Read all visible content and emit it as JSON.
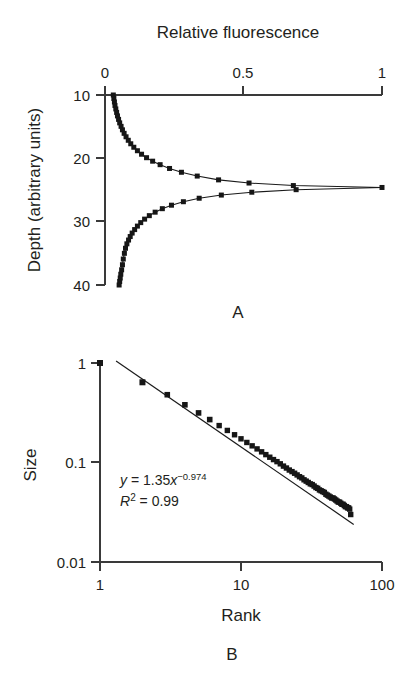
{
  "figure": {
    "background_color": "#ffffff",
    "ink_color": "#231f20",
    "marker_color": "#161616",
    "axis_color": "#3a3a3a"
  },
  "panels": [
    {
      "letter": "A",
      "name": "fluorescence-depth-profile"
    },
    {
      "letter": "B",
      "name": "rank-size-power-law"
    }
  ],
  "chart_data": [
    {
      "type": "line",
      "panel": "A",
      "title": "Relative fluorescence",
      "xlabel": "Relative fluorescence",
      "ylabel": "Depth (arbitrary units)",
      "xlim": [
        0,
        1
      ],
      "ylim": [
        40,
        10
      ],
      "y_inverted": true,
      "x_axis_position": "top",
      "grid": false,
      "legend": null,
      "xticks": [
        0,
        0.5,
        1
      ],
      "xticklabels": [
        "0",
        "0.5",
        "1"
      ],
      "yticks": [
        10,
        20,
        30,
        40
      ],
      "yticklabels": [
        "10",
        "20",
        "30",
        "40"
      ],
      "annotations": [
        "A"
      ],
      "series": [
        {
          "name": "fluorescence",
          "x": [
            0.03,
            0.032,
            0.034,
            0.036,
            0.039,
            0.042,
            0.045,
            0.049,
            0.053,
            0.058,
            0.063,
            0.069,
            0.076,
            0.084,
            0.093,
            0.104,
            0.117,
            0.132,
            0.15,
            0.172,
            0.199,
            0.233,
            0.276,
            0.333,
            0.41,
            0.52,
            0.68,
            1.0,
            0.69,
            0.53,
            0.42,
            0.34,
            0.283,
            0.24,
            0.207,
            0.181,
            0.16,
            0.143,
            0.129,
            0.117,
            0.107,
            0.098,
            0.091,
            0.085,
            0.079,
            0.074,
            0.07,
            0.066,
            0.063,
            0.06,
            0.057,
            0.055,
            0.053,
            0.051
          ],
          "y": [
            10.0,
            10.55,
            11.1,
            11.65,
            12.2,
            12.75,
            13.3,
            13.85,
            14.4,
            14.95,
            15.5,
            16.05,
            16.6,
            17.15,
            17.7,
            18.25,
            18.8,
            19.35,
            19.9,
            20.45,
            21.0,
            21.6,
            22.2,
            22.8,
            23.4,
            23.9,
            24.3,
            24.6,
            24.95,
            25.35,
            25.8,
            26.3,
            26.85,
            27.4,
            27.95,
            28.5,
            29.05,
            29.6,
            30.15,
            30.7,
            31.25,
            31.8,
            32.35,
            32.9,
            33.5,
            34.2,
            35.0,
            35.9,
            36.8,
            37.6,
            38.3,
            38.9,
            39.45,
            40.0
          ]
        }
      ]
    },
    {
      "type": "scatter",
      "panel": "B",
      "title": "",
      "xlabel": "Rank",
      "ylabel": "Size",
      "xscale": "log",
      "yscale": "log",
      "xlim": [
        1,
        100
      ],
      "ylim": [
        0.01,
        1
      ],
      "grid": false,
      "legend": null,
      "xticks": [
        1,
        10,
        100
      ],
      "xticklabels": [
        "1",
        "10",
        "100"
      ],
      "yticks": [
        0.01,
        0.1,
        1
      ],
      "yticklabels": [
        "0.01",
        "0.1",
        "1"
      ],
      "fit": {
        "equation_y": "y",
        "equation_eq": " = 1.35",
        "equation_x": "x",
        "equation_exp": "−0.974",
        "r2_label": "R",
        "r2_sup": "2",
        "r2_value": " = 0.99",
        "coefficient": 1.35,
        "exponent": -0.974,
        "r_squared": 0.99,
        "x_start": 1.3,
        "x_end": 63
      },
      "annotations": [
        "B"
      ],
      "series": [
        {
          "name": "rank-size",
          "x": [
            1,
            2,
            3,
            4,
            5,
            6,
            7,
            8,
            9,
            10,
            11,
            12,
            13,
            14,
            15,
            16,
            17,
            18,
            19,
            20,
            21,
            22,
            23,
            24,
            25,
            26,
            27,
            28,
            29,
            30,
            31,
            32,
            33,
            34,
            35,
            36,
            37,
            38,
            39,
            40,
            41,
            42,
            43,
            44,
            45,
            46,
            47,
            48,
            49,
            50,
            51,
            52,
            53,
            54,
            55,
            56,
            57,
            58,
            59,
            60
          ],
          "y": [
            1.0,
            0.64,
            0.48,
            0.38,
            0.315,
            0.27,
            0.235,
            0.21,
            0.19,
            0.173,
            0.159,
            0.147,
            0.137,
            0.128,
            0.12,
            0.113,
            0.107,
            0.102,
            0.097,
            0.092,
            0.088,
            0.084,
            0.081,
            0.078,
            0.075,
            0.072,
            0.07,
            0.067,
            0.065,
            0.063,
            0.061,
            0.06,
            0.058,
            0.056,
            0.055,
            0.053,
            0.052,
            0.051,
            0.05,
            0.048,
            0.047,
            0.046,
            0.045,
            0.044,
            0.044,
            0.043,
            0.042,
            0.041,
            0.04,
            0.04,
            0.039,
            0.038,
            0.038,
            0.037,
            0.036,
            0.036,
            0.035,
            0.035,
            0.034,
            0.03
          ]
        }
      ]
    }
  ]
}
